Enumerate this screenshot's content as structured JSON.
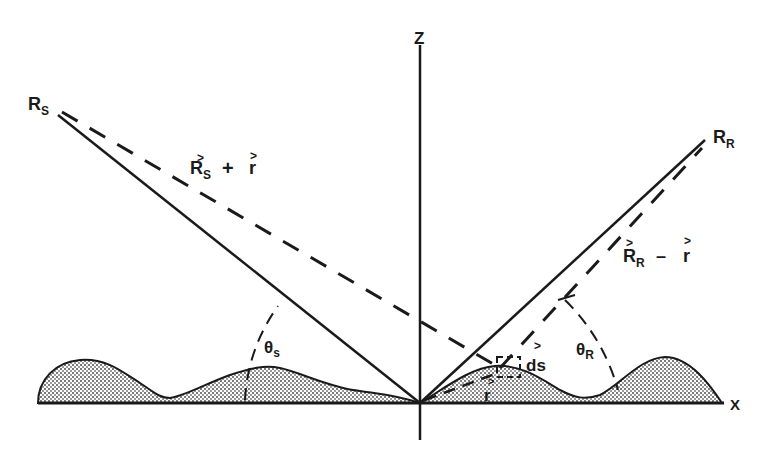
{
  "diagram": {
    "type": "bistatic scattering geometry",
    "axes": {
      "x_label": "X",
      "z_label": "Z"
    },
    "points": {
      "source": {
        "label": "R",
        "subscript": "S"
      },
      "receiver": {
        "label": "R",
        "subscript": "R"
      }
    },
    "vectors": {
      "source_plus_r": {
        "main": "R",
        "sub": "S",
        "op": "+",
        "rhs": "r"
      },
      "receiver_minus_r": {
        "main": "R",
        "sub": "R",
        "op": "–",
        "rhs": "r"
      },
      "position_r": "r",
      "surface_element": "ds"
    },
    "angles": {
      "theta_s": {
        "symbol": "θ",
        "subscript": "s"
      },
      "theta_r": {
        "symbol": "θ",
        "subscript": "R"
      }
    },
    "vector_arrow_glyph": ">",
    "colors": {
      "ink": "#1a1a1a",
      "background": "#ffffff",
      "surface_fill": "#bdbdbd"
    }
  }
}
